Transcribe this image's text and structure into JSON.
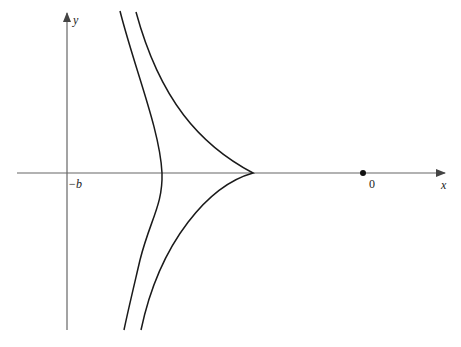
{
  "figure": {
    "axes": {
      "x_label": "x",
      "y_label": "y",
      "tick_labels": [
        {
          "text": "−b",
          "position": "left vertical axis foot"
        },
        {
          "text": "0",
          "position": "origin point"
        }
      ]
    },
    "curves": [
      {
        "name": "inner-curve",
        "description": "smooth curve crossing x-axis left of cusp"
      },
      {
        "name": "cusp-curve",
        "description": "curve with a cusp on the x-axis"
      }
    ],
    "points": [
      {
        "name": "origin-point",
        "label": "0"
      }
    ],
    "colors": {
      "curve": "#1a1a1a",
      "axis": "#555555"
    }
  }
}
